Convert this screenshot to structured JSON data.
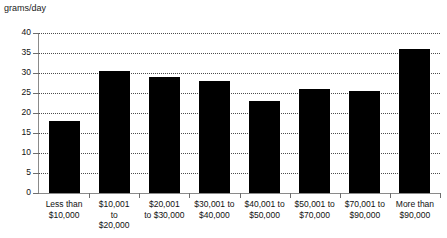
{
  "chart_data": {
    "type": "bar",
    "title": "",
    "ylabel": "grams/day",
    "xlabel": "",
    "ylim": [
      0,
      40
    ],
    "ytick_step": 5,
    "yticks": [
      "40",
      "35",
      "30",
      "25",
      "20",
      "15",
      "10",
      "5",
      "0"
    ],
    "grid": true,
    "legend": false,
    "bar_color": "#000000",
    "categories": [
      "Less than\n$10,000",
      "$10,001\nto\n$20,000",
      "$20,001\nto $30,000",
      "$30,001 to\n$40,000",
      "$40,001 to\n$50,000",
      "$50,001 to\n$70,000",
      "$70,001 to\n$90,000",
      "More than\n$90,000"
    ],
    "category_lines": [
      [
        "Less than",
        "$10,000"
      ],
      [
        "$10,001",
        "to",
        "$20,000"
      ],
      [
        "$20,001",
        "to $30,000"
      ],
      [
        "$30,001 to",
        "$40,000"
      ],
      [
        "$40,001 to",
        "$50,000"
      ],
      [
        "$50,001 to",
        "$70,000"
      ],
      [
        "$70,001 to",
        "$90,000"
      ],
      [
        "More than",
        "$90,000"
      ]
    ],
    "values": [
      18,
      30.5,
      29,
      28,
      23,
      26,
      25.5,
      36
    ]
  },
  "axis": {
    "y_unit_label": "grams/day"
  }
}
